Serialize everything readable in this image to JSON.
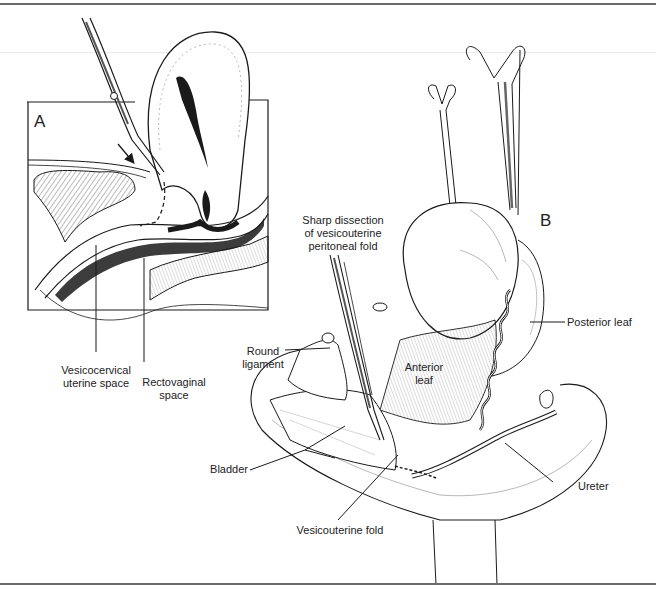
{
  "figure": {
    "panel_a": {
      "letter": "A",
      "labels": {
        "vesicocervical_line1": "Vesicocervical",
        "vesicocervical_line2": "uterine space",
        "rectovaginal_line1": "Rectovaginal",
        "rectovaginal_line2": "space"
      }
    },
    "panel_b": {
      "letter": "B",
      "labels": {
        "sharp_line1": "Sharp dissection",
        "sharp_line2": "of vesicouterine",
        "sharp_line3": "peritoneal fold",
        "round_line1": "Round",
        "round_line2": "ligament",
        "anterior_line1": "Anterior",
        "anterior_line2": "leaf",
        "posterior_leaf": "Posterior leaf",
        "bladder": "Bladder",
        "ureter": "Ureter",
        "vesicouterine_fold": "Vesicouterine fold"
      }
    },
    "colors": {
      "ink": "#1a1a1a",
      "rule": "#6a6a6a",
      "hatch": "#555555",
      "background": "#ffffff"
    }
  }
}
